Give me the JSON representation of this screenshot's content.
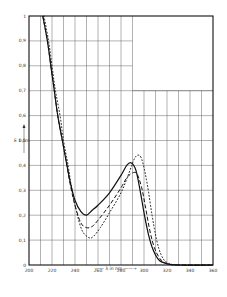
{
  "chart_data": {
    "type": "line",
    "title": "",
    "xlabel": "λ in nm",
    "ylabel": "E 1 cm",
    "xlim": [
      200,
      360
    ],
    "ylim": [
      0,
      1
    ],
    "x_ticks": [
      200,
      220,
      240,
      260,
      280,
      300,
      320,
      340,
      360
    ],
    "x_tick_labels": [
      "200",
      "220",
      "240",
      "260",
      "280",
      "300",
      "320",
      "340",
      "360"
    ],
    "y_ticks": [
      0,
      0.1,
      0.2,
      0.3,
      0.4,
      0.5,
      0.6,
      0.7,
      0.8,
      0.9,
      1
    ],
    "y_tick_labels": [
      "0",
      "0,1",
      "0,2",
      "0,3",
      "0,4",
      "0,5",
      "0,6",
      "0,7",
      "0,8",
      "0,9",
      "1"
    ],
    "grid": true,
    "grid_x_step": 10,
    "grid_y_step": 0.1,
    "blank_region": {
      "x_from": 290,
      "y_from": 0.7
    },
    "legend": null,
    "series": [
      {
        "name": "solid",
        "style": "solid",
        "x": [
          212,
          216,
          219,
          222,
          225,
          229,
          233,
          236,
          240,
          245,
          250,
          255,
          260,
          270,
          280,
          285,
          289,
          293,
          297,
          300,
          304,
          308,
          313,
          320,
          330,
          360
        ],
        "values": [
          1.0,
          0.9,
          0.8,
          0.7,
          0.6,
          0.5,
          0.4,
          0.33,
          0.26,
          0.215,
          0.2,
          0.22,
          0.24,
          0.29,
          0.36,
          0.4,
          0.41,
          0.38,
          0.29,
          0.21,
          0.12,
          0.06,
          0.02,
          0.005,
          0,
          0
        ]
      },
      {
        "name": "dashed",
        "style": "dashed",
        "x": [
          212,
          216,
          219,
          222,
          225,
          229,
          233,
          236,
          240,
          245,
          250,
          255,
          260,
          270,
          280,
          285,
          290,
          294,
          298,
          301,
          305,
          309,
          314,
          320,
          330,
          360
        ],
        "values": [
          1.0,
          0.9,
          0.8,
          0.7,
          0.6,
          0.5,
          0.4,
          0.32,
          0.24,
          0.17,
          0.15,
          0.155,
          0.18,
          0.24,
          0.31,
          0.35,
          0.37,
          0.365,
          0.31,
          0.24,
          0.14,
          0.07,
          0.025,
          0.005,
          0,
          0
        ]
      },
      {
        "name": "dotted",
        "style": "dotted",
        "x": [
          213,
          217,
          220,
          223,
          227,
          230,
          234,
          237,
          241,
          246,
          252,
          256,
          262,
          270,
          280,
          287,
          292,
          296,
          299,
          303,
          307,
          311,
          315,
          320,
          330,
          360
        ],
        "values": [
          1.0,
          0.9,
          0.8,
          0.7,
          0.6,
          0.5,
          0.4,
          0.31,
          0.22,
          0.14,
          0.11,
          0.115,
          0.15,
          0.21,
          0.29,
          0.37,
          0.43,
          0.44,
          0.41,
          0.32,
          0.2,
          0.1,
          0.04,
          0.01,
          0,
          0
        ]
      }
    ]
  },
  "axis": {
    "x_label_text": "—— λ in nm ——→",
    "y_label_text": "E 1 cm"
  }
}
